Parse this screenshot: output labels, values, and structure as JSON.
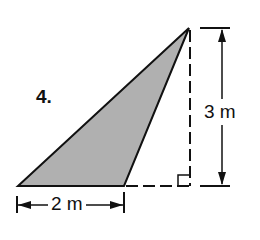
{
  "problem": {
    "number": "4.",
    "height_label": "3 m",
    "base_label": "2 m",
    "shape": "obtuse triangle with external altitude",
    "fill_color": "#b0b0b0",
    "line_color": "#111111"
  }
}
